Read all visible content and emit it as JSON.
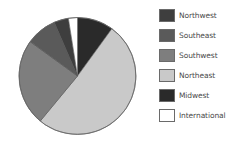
{
  "chart_data": {
    "type": "pie",
    "title": "",
    "start_angle_deg": 0,
    "direction": "clockwise",
    "slices": [
      {
        "label": "Midwest",
        "value": 10,
        "color": "#2a2a2a"
      },
      {
        "label": "Northeast",
        "value": 51,
        "color": "#c9c9c9"
      },
      {
        "label": "Southwest",
        "value": 24,
        "color": "#7e7e7e"
      },
      {
        "label": "Southeast",
        "value": 8.5,
        "color": "#5a5a5a"
      },
      {
        "label": "Northwest",
        "value": 4,
        "color": "#3e3e3e"
      },
      {
        "label": "International",
        "value": 2.5,
        "color": "#ffffff"
      }
    ],
    "legend": {
      "position": "right",
      "entries": [
        {
          "label": "Northwest",
          "color": "#3e3e3e"
        },
        {
          "label": "Southeast",
          "color": "#5a5a5a"
        },
        {
          "label": "Southwest",
          "color": "#7e7e7e"
        },
        {
          "label": "Northeast",
          "color": "#c9c9c9"
        },
        {
          "label": "Midwest",
          "color": "#2a2a2a"
        },
        {
          "label": "International",
          "color": "#ffffff"
        }
      ]
    },
    "grid": false
  }
}
